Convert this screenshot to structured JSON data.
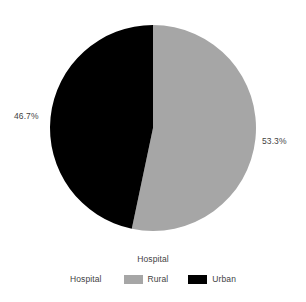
{
  "chart_data": {
    "type": "pie",
    "title": "",
    "categories": [
      "Rural",
      "Urban"
    ],
    "values": [
      53.3,
      46.7
    ],
    "value_labels": [
      "53.3%",
      "46.7%"
    ],
    "colors": [
      "#a6a6a6",
      "#000000"
    ],
    "legend_title": "Hospital",
    "legend_axis_name": "Hospital",
    "legend_position": "bottom",
    "start_angle_deg": 0,
    "direction": "clockwise",
    "xlabel": "",
    "ylabel": "",
    "grid": false
  },
  "labels": {
    "left_percent": "46.7%",
    "right_percent": "53.3%"
  },
  "legend": {
    "title": "Hospital",
    "axis_name": "Hospital",
    "items": [
      {
        "label": "Rural",
        "color": "#a6a6a6"
      },
      {
        "label": "Urban",
        "color": "#000000"
      }
    ]
  },
  "geometry": {
    "center_x": 153,
    "center_y": 128,
    "radius": 103
  }
}
